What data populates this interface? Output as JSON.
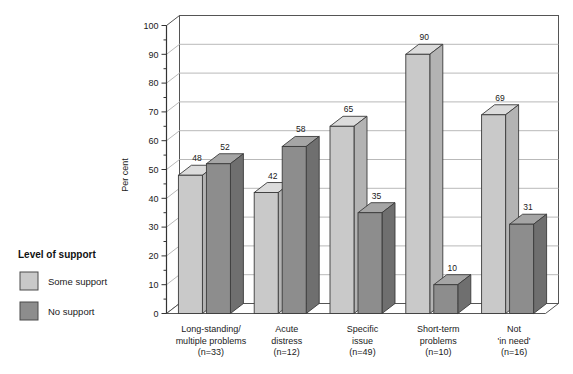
{
  "chart_data": {
    "type": "bar",
    "title": "",
    "subtitle": "",
    "xlabel": "",
    "ylabel": "Per cent",
    "ylim": [
      0,
      100
    ],
    "ytick_step": 10,
    "yticks": [
      "0",
      "10",
      "20",
      "30",
      "40",
      "50",
      "60",
      "70",
      "80",
      "90",
      "100"
    ],
    "grid": true,
    "style": "3d-column",
    "legend_position": "left-outside",
    "legend_title": "Level of support",
    "categories": [
      "Long-standing/\nmultiple problems\n(n=33)",
      "Acute\ndistress\n(n=12)",
      "Specific\nissue\n(n=49)",
      "Short-term\nproblems\n(n=10)",
      "Not\n'in need'\n(n=16)"
    ],
    "category_lines": [
      [
        "Long-standing/",
        "multiple problems",
        "(n=33)"
      ],
      [
        "Acute",
        "distress",
        "(n=12)"
      ],
      [
        "Specific",
        "issue",
        "(n=49)"
      ],
      [
        "Short-term",
        "problems",
        "(n=10)"
      ],
      [
        "Not",
        "'in need'",
        "(n=16)"
      ]
    ],
    "series": [
      {
        "name": "Some support",
        "color": "#c9c9c9",
        "values": [
          48,
          42,
          65,
          90,
          69
        ]
      },
      {
        "name": "No support",
        "color": "#8d8d8d",
        "values": [
          52,
          58,
          35,
          10,
          31
        ]
      }
    ],
    "data_labels": [
      [
        "48",
        "52"
      ],
      [
        "42",
        "58"
      ],
      [
        "65",
        "35"
      ],
      [
        "90",
        "10"
      ],
      [
        "69",
        "31"
      ]
    ]
  },
  "legend": {
    "title": "Level of support",
    "items": [
      {
        "label": "Some support",
        "color": "#c9c9c9"
      },
      {
        "label": "No support",
        "color": "#8d8d8d"
      }
    ]
  },
  "axes": {
    "y_title": "Per cent",
    "y_ticks": [
      "100",
      "90",
      "80",
      "70",
      "60",
      "50",
      "40",
      "30",
      "20",
      "10",
      "0"
    ]
  },
  "colors": {
    "some_support": "#c9c9c9",
    "some_support_top": "#dcdcdc",
    "some_support_side": "#b3b3b3",
    "no_support": "#8d8d8d",
    "no_support_top": "#a5a5a5",
    "no_support_side": "#6f6f6f",
    "grid": "#b9b9b9",
    "axis": "#333333",
    "floor": "#ffffff",
    "background": "#ffffff"
  }
}
